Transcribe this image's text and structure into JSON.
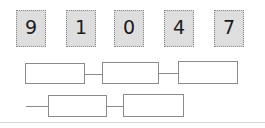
{
  "worksheet": {
    "title": "Place value digit tiles and answer boxes",
    "background_color": "#ffffff",
    "tile_fill_color": "#d9d9d9",
    "tile_border_color": "#8c8c8c",
    "box_border_color": "#8a8a8f",
    "digit_color": "#1b1b1b"
  },
  "digit_tiles": [
    {
      "label": "9",
      "name": "digit-tile-9"
    },
    {
      "label": "1",
      "name": "digit-tile-1"
    },
    {
      "label": "0",
      "name": "digit-tile-0"
    },
    {
      "label": "4",
      "name": "digit-tile-4"
    },
    {
      "label": "7",
      "name": "digit-tile-7"
    }
  ],
  "answer_rows": [
    {
      "name": "answer-row-top",
      "boxes": [
        {
          "value": "",
          "placeholder": ""
        },
        {
          "value": "",
          "placeholder": ""
        },
        {
          "value": "",
          "placeholder": ""
        }
      ]
    },
    {
      "name": "answer-row-bottom",
      "boxes": [
        {
          "value": "",
          "placeholder": ""
        },
        {
          "value": "",
          "placeholder": ""
        }
      ]
    }
  ]
}
